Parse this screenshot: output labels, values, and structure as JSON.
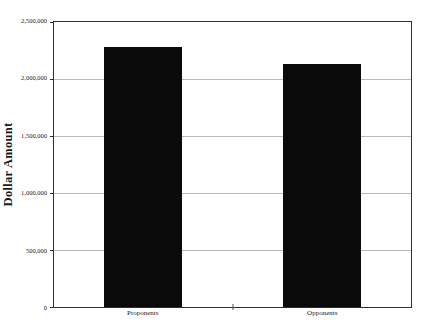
{
  "figure": {
    "background": "#ffffff"
  },
  "chart_data": {
    "type": "bar",
    "title": "",
    "categories": [
      "Proponents",
      "Opponents"
    ],
    "values": [
      2280000,
      2130000
    ],
    "xlabel": "",
    "ylabel": "Dollar Amount",
    "ylim": [
      0,
      2500000
    ],
    "ytick_interval": 500000,
    "yticks": [
      {
        "value": 0,
        "label": "0"
      },
      {
        "value": 500000,
        "label": "500,000"
      },
      {
        "value": 1000000,
        "label": "1,000,000"
      },
      {
        "value": 1500000,
        "label": "1,500,000"
      },
      {
        "value": 2000000,
        "label": "2,000,000"
      },
      {
        "value": 2500000,
        "label": "2,500,000"
      }
    ],
    "grid": "horizontal",
    "legend": "none",
    "bar_color": "#0a0a0a",
    "gridline_color": "#b8b8b8",
    "axis_color": "#2e2e2e"
  }
}
